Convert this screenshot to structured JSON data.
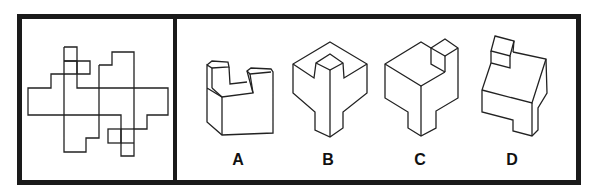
{
  "puzzle": {
    "question_panel": {
      "content": "unfolded-cube-net"
    },
    "options": [
      {
        "label": "A"
      },
      {
        "label": "B"
      },
      {
        "label": "C"
      },
      {
        "label": "D"
      }
    ]
  },
  "colors": {
    "line": "#222222",
    "frame": "#1a1a1a",
    "background": "#ffffff"
  }
}
